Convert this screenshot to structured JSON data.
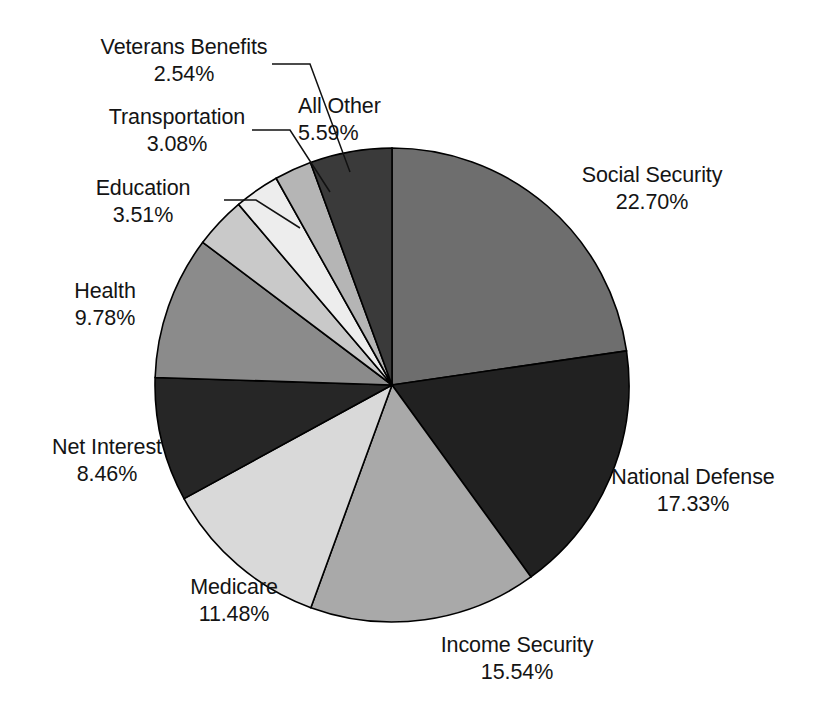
{
  "chart_data": {
    "type": "pie",
    "title": "Federal Budget Outlays by Function",
    "title_visible": false,
    "legend": "none",
    "start_angle_deg": 0,
    "direction": "clockwise",
    "units": "percent",
    "categories": [
      "Social Security",
      "National Defense",
      "Income Security",
      "Medicare",
      "Net Interest",
      "Health",
      "Education",
      "Transportation",
      "Veterans Benefits",
      "All Other"
    ],
    "values": [
      22.7,
      17.33,
      15.54,
      11.48,
      8.46,
      9.78,
      3.51,
      3.08,
      2.54,
      5.59
    ],
    "slices": [
      {
        "key": "social_security",
        "label": "Social Security",
        "pct_text": "22.70%",
        "value": 22.7,
        "color": "#6e6e6e"
      },
      {
        "key": "national_defense",
        "label": "National Defense",
        "pct_text": "17.33%",
        "value": 17.33,
        "color": "#212121"
      },
      {
        "key": "income_security",
        "label": "Income Security",
        "pct_text": "15.54%",
        "value": 15.54,
        "color": "#a9a9a9"
      },
      {
        "key": "medicare",
        "label": "Medicare",
        "pct_text": "11.48%",
        "value": 11.48,
        "color": "#d9d9d9"
      },
      {
        "key": "net_interest",
        "label": "Net Interest",
        "pct_text": "8.46%",
        "value": 8.46,
        "color": "#262626"
      },
      {
        "key": "health",
        "label": "Health",
        "pct_text": "9.78%",
        "value": 9.78,
        "color": "#8b8b8b"
      },
      {
        "key": "education",
        "label": "Education",
        "pct_text": "3.51%",
        "value": 3.51,
        "color": "#c9c9c9"
      },
      {
        "key": "transportation",
        "label": "Transportation",
        "pct_text": "3.08%",
        "value": 3.08,
        "color": "#ededed"
      },
      {
        "key": "veterans",
        "label": "Veterans Benefits",
        "pct_text": "2.54%",
        "value": 2.54,
        "color": "#b5b5b5"
      },
      {
        "key": "all_other",
        "label": "All Other",
        "pct_text": "5.59%",
        "value": 5.59,
        "color": "#3a3a3a"
      }
    ]
  },
  "labels": {
    "social_security": {
      "name": "Social Security",
      "pct": "22.70%"
    },
    "national_defense": {
      "name": "National Defense",
      "pct": "17.33%"
    },
    "income_security": {
      "name": "Income Security",
      "pct": "15.54%"
    },
    "medicare": {
      "name": "Medicare",
      "pct": "11.48%"
    },
    "net_interest": {
      "name": "Net Interest",
      "pct": "8.46%"
    },
    "health": {
      "name": "Health",
      "pct": "9.78%"
    },
    "education": {
      "name": "Education",
      "pct": "3.51%"
    },
    "transportation": {
      "name": "Transportation",
      "pct": "3.08%"
    },
    "veterans": {
      "name": "Veterans Benefits",
      "pct": "2.54%"
    },
    "all_other": {
      "name": "All Other",
      "pct": "5.59%"
    }
  },
  "geometry": {
    "center_x": 392,
    "center_y": 385,
    "radius": 237
  }
}
